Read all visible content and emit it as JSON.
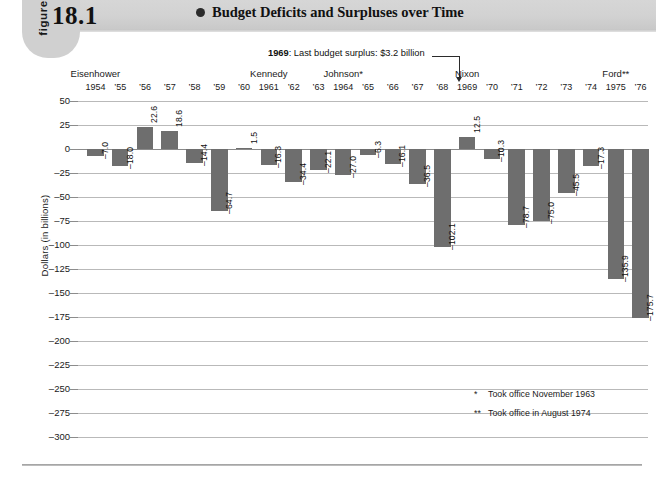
{
  "header": {
    "figure_word": "figure",
    "figure_number": "18.1",
    "title": "Budget Deficits and Surpluses over Time",
    "bullet_icon": "filled-circle-bullet"
  },
  "annotation": {
    "year": "1969",
    "text": ": Last budget surplus: $3.2 billion",
    "arrow_icon": "down-arrow-icon"
  },
  "footnotes": [
    {
      "mark": "*",
      "text": "Took office November 1963"
    },
    {
      "mark": "**",
      "text": "Took office in August 1974"
    }
  ],
  "presidents": [
    {
      "name": "Eisenhower",
      "start_year": "1954",
      "end_year": "1960"
    },
    {
      "name": "Kennedy",
      "start_year": "1961",
      "end_year": "1963"
    },
    {
      "name": "Johnson*",
      "start_year": "1964",
      "end_year": "1968"
    },
    {
      "name": "Nixon",
      "start_year": "1969",
      "end_year": "1974"
    },
    {
      "name": "Ford**",
      "start_year": "1975",
      "end_year": "1976"
    }
  ],
  "chart_data": {
    "type": "bar",
    "title": "Budget Deficits and Surpluses over Time",
    "xlabel": "",
    "ylabel": "Dollars (in billions)",
    "ylim": [
      -300,
      50
    ],
    "ytick_step": 25,
    "yticks": [
      "50",
      "25",
      "0",
      "-25",
      "-50",
      "-75",
      "-100",
      "-125",
      "-150",
      "-175",
      "-200",
      "-225",
      "-250",
      "-275",
      "-300"
    ],
    "grid": true,
    "legend": "none",
    "bar_color": "#6e6e6e",
    "categories": [
      "1954",
      "'55",
      "'56",
      "'57",
      "'58",
      "'59",
      "'60",
      "1961",
      "'62",
      "'63",
      "1964",
      "'65",
      "'66",
      "'67",
      "'68",
      "1969",
      "'70",
      "'71",
      "'72",
      "'73",
      "'74",
      "1975",
      "'76"
    ],
    "values": [
      -7.0,
      -18.0,
      22.6,
      18.6,
      -14.4,
      -64.7,
      1.5,
      -16.3,
      -34.4,
      -22.1,
      -27.0,
      -6.3,
      -16.1,
      -36.5,
      -102.1,
      12.5,
      -10.3,
      -78.7,
      -75.0,
      -45.5,
      -17.3,
      -135.9,
      -175.7
    ],
    "value_labels": [
      "-7.0",
      "-18.0",
      "22.6",
      "18.6",
      "-14.4",
      "-64.7",
      "1.5",
      "-16.3",
      "-34.4",
      "-22.1",
      "-27.0",
      "-6.3",
      "-16.1",
      "-36.5",
      "-102.1",
      "12.5",
      "-10.3",
      "-78.7",
      "-75.0",
      "-45.5",
      "-17.3",
      "-135.9",
      "-175.7"
    ]
  }
}
